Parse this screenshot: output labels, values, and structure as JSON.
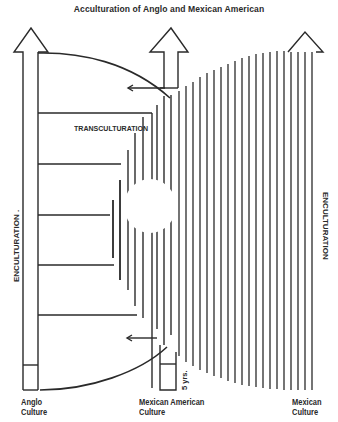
{
  "title": "Acculturation of Anglo and Mexican American",
  "labels": {
    "transculturation": "TRANSCULTURATION",
    "enculturation_left": "ENCULTURATION .",
    "enculturation_right": "ENCULTURATION",
    "five_years": "5 yrs.",
    "anglo_culture_line1": "Anglo",
    "anglo_culture_line2": "Culture",
    "mexican_american_culture_line1": "Mexican American",
    "mexican_american_culture_line2": "Culture",
    "mexican_culture_line1": "Mexican",
    "mexican_culture_line2": "Culture"
  },
  "diagram": {
    "columns": [
      {
        "name": "Anglo Culture",
        "arrow": "up"
      },
      {
        "name": "Mexican American Culture",
        "arrow": "up"
      },
      {
        "name": "Mexican Culture",
        "arrow": "up"
      }
    ],
    "left_horizontal_lines": 5,
    "right_vertical_line_count": 25,
    "transfer_arrows": [
      "top-left-pointing",
      "bottom-left-pointing"
    ],
    "line_color": "#2a2a2a"
  }
}
